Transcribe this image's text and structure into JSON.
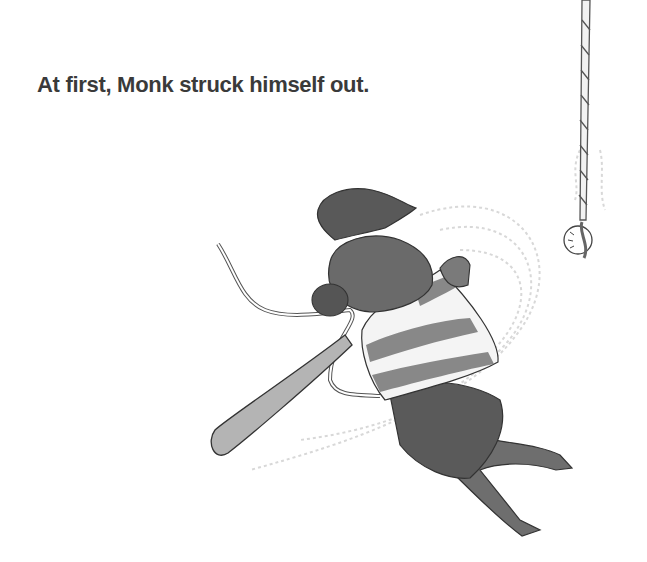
{
  "page": {
    "caption": "At first, Monk struck himself out."
  },
  "illustration": {
    "subject": "mouse-batter-swinging",
    "elements": [
      "baseball-cap",
      "striped-shirt",
      "baseball-bat",
      "tail",
      "ball-on-rope",
      "swing-motion-lines"
    ],
    "colors": {
      "ink": "#2e2e2e",
      "wash_dark": "#5a5a5a",
      "wash_mid": "#7d7d7d",
      "wash_light": "#a8a8a8",
      "motion": "#d8d8d8"
    }
  }
}
